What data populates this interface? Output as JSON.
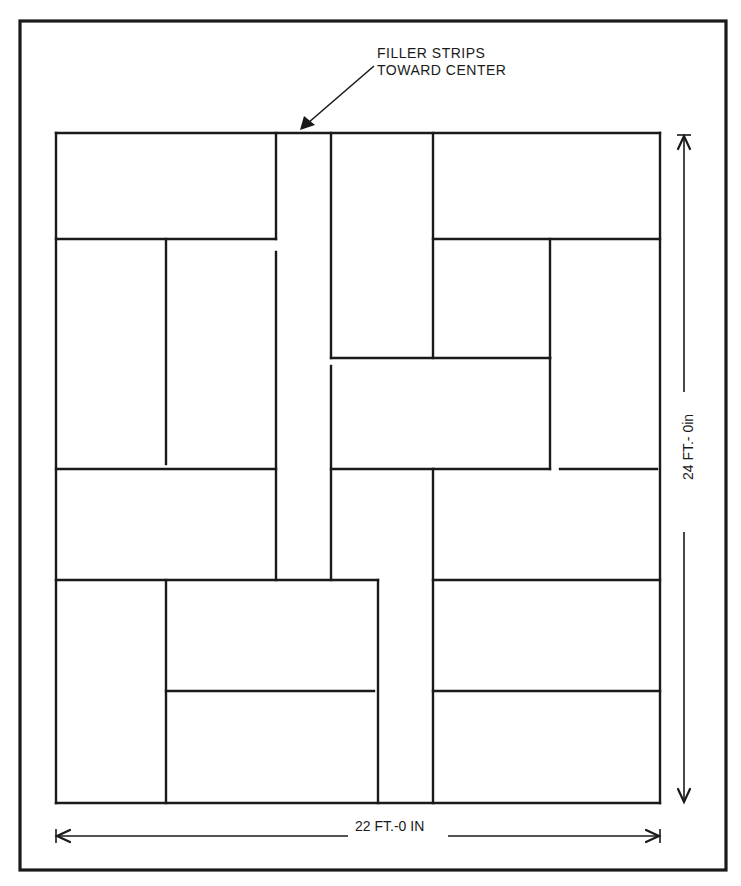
{
  "diagram": {
    "type": "floor tile layout plan",
    "callout": {
      "line1": "FILLER STRIPS",
      "line2": "TOWARD CENTER",
      "arrow_from": [
        374,
        66
      ],
      "arrow_to": [
        300,
        130
      ]
    },
    "dimensions": {
      "width_label": "22 FT.-0 IN",
      "height_label": "24 FT.- 0in"
    },
    "colors": {
      "ink": "#1a1a1a",
      "paper": "#ffffff"
    },
    "outer_frame": {
      "x": 20,
      "y": 21,
      "w": 706,
      "h": 849
    },
    "plan_bounds": {
      "x1": 56,
      "y1": 133,
      "x2": 660,
      "y2": 803
    },
    "walls": [
      [
        56,
        133,
        660,
        133
      ],
      [
        56,
        803,
        660,
        803
      ],
      [
        56,
        133,
        56,
        803
      ],
      [
        660,
        133,
        660,
        803
      ],
      [
        56,
        239,
        276,
        239
      ],
      [
        166,
        239,
        166,
        464
      ],
      [
        276,
        133,
        276,
        239
      ],
      [
        276,
        252,
        276,
        580
      ],
      [
        56,
        469,
        276,
        469
      ],
      [
        56,
        580,
        378,
        580
      ],
      [
        331,
        133,
        331,
        358
      ],
      [
        331,
        366,
        331,
        580
      ],
      [
        433,
        133,
        433,
        358
      ],
      [
        331,
        358,
        550,
        358
      ],
      [
        331,
        469,
        550,
        469
      ],
      [
        550,
        358,
        550,
        469
      ],
      [
        433,
        469,
        433,
        803
      ],
      [
        433,
        239,
        660,
        239
      ],
      [
        550,
        239,
        550,
        358
      ],
      [
        560,
        469,
        657,
        469
      ],
      [
        433,
        580,
        660,
        580
      ],
      [
        433,
        691,
        660,
        691
      ],
      [
        166,
        580,
        166,
        803
      ],
      [
        378,
        580,
        378,
        803
      ],
      [
        166,
        691,
        374,
        691
      ]
    ],
    "dimension_lines": {
      "horizontal": {
        "y": 836,
        "x1": 56,
        "x2": 660,
        "gap": [
          348,
          448
        ]
      },
      "vertical": {
        "x": 684,
        "y1": 135,
        "y2": 803,
        "gap": [
          392,
          532
        ]
      }
    }
  }
}
